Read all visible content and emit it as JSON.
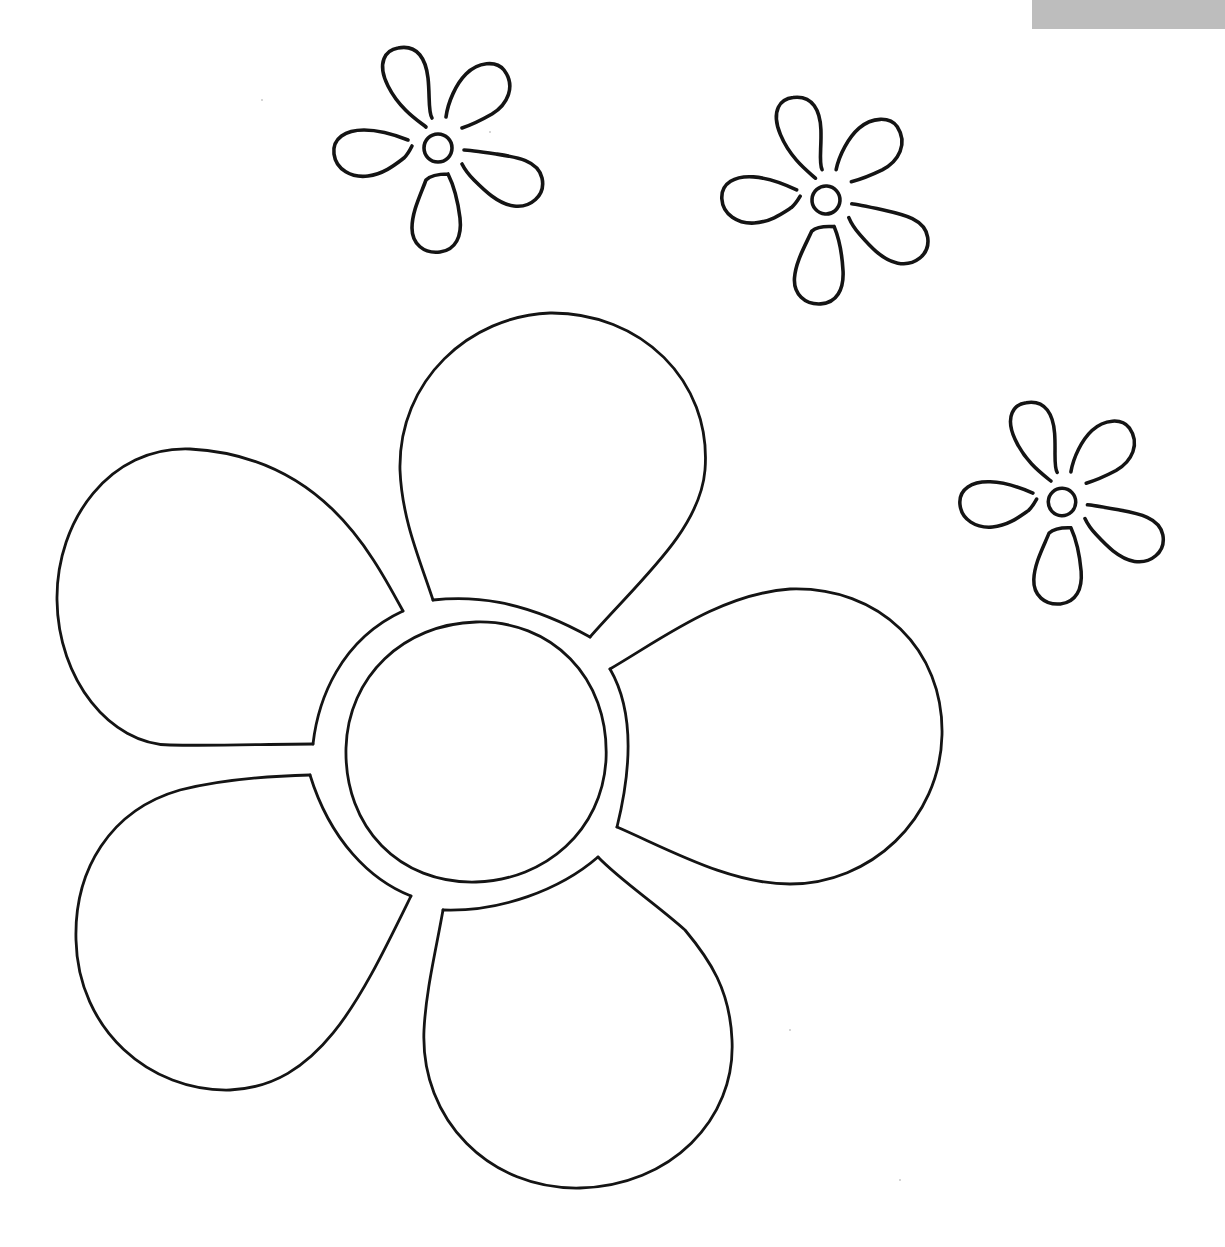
{
  "page": {
    "title": "Flower coloring page",
    "background_color": "#ffffff",
    "line_color": "#141414"
  },
  "corner_tab": {
    "color": "#bdbdbd",
    "x": 1032,
    "y": 0,
    "width": 193,
    "height": 29
  },
  "drawing": {
    "large_flower": {
      "name": "large-flower",
      "center": [
        476,
        753
      ],
      "inner_circle_radius": 130,
      "ring_radius": 157,
      "petal_count": 5
    },
    "small_flowers": [
      {
        "name": "small-flower-1",
        "center": [
          438,
          148
        ],
        "scale": 1.0,
        "rotation": 0
      },
      {
        "name": "small-flower-2",
        "center": [
          826,
          200
        ],
        "scale": 1.0,
        "rotation": 4
      },
      {
        "name": "small-flower-3",
        "center": [
          1062,
          502
        ],
        "scale": 0.98,
        "rotation": 2
      }
    ]
  }
}
